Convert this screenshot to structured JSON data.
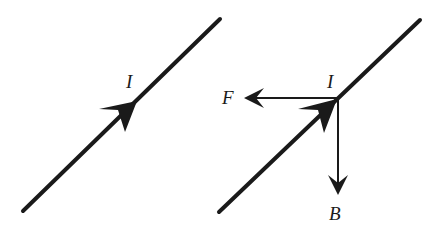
{
  "diagram": {
    "type": "physics-vector-diagram",
    "colors": {
      "stroke": "#1a1a1a",
      "background": "#ffffff"
    },
    "panels": [
      {
        "id": "left",
        "wire": {
          "x1": 23,
          "y1": 211,
          "x2": 220,
          "y2": 19
        },
        "current_arrow_tip": {
          "x": 137,
          "y": 101
        },
        "labels": {
          "current": "I"
        }
      },
      {
        "id": "right",
        "wire": {
          "x1": 219,
          "y1": 212,
          "x2": 420,
          "y2": 20
        },
        "current_arrow_tip": {
          "x": 337,
          "y": 99
        },
        "junction": {
          "x": 338,
          "y": 98
        },
        "force_arrow": {
          "x2": 245,
          "y2": 98
        },
        "field_arrow": {
          "x2": 338,
          "y2": 195
        },
        "labels": {
          "current": "I",
          "force": "F",
          "field": "B"
        }
      }
    ]
  }
}
